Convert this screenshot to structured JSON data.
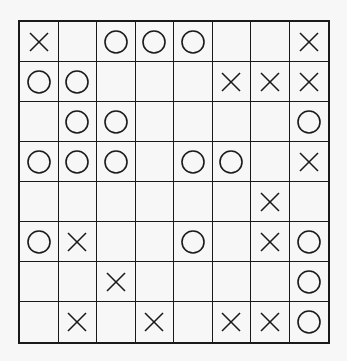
{
  "board": {
    "rows": 8,
    "cols": 8,
    "colors": {
      "line": "#1a1a1a",
      "background": "#f7f7f7",
      "mark": "#1a1a1a"
    },
    "cells": [
      [
        "X",
        "",
        "O",
        "O",
        "O",
        "",
        "",
        "X"
      ],
      [
        "O",
        "O",
        "",
        "",
        "",
        "X",
        "X",
        "X"
      ],
      [
        "",
        "O",
        "O",
        "",
        "",
        "",
        "",
        "O"
      ],
      [
        "O",
        "O",
        "O",
        "",
        "O",
        "O",
        "",
        "X"
      ],
      [
        "",
        "",
        "",
        "",
        "",
        "",
        "X",
        ""
      ],
      [
        "O",
        "X",
        "",
        "",
        "O",
        "",
        "X",
        "O"
      ],
      [
        "",
        "",
        "X",
        "",
        "",
        "",
        "",
        "O"
      ],
      [
        "",
        "X",
        "",
        "X",
        "",
        "X",
        "X",
        "O"
      ]
    ],
    "icons": {
      "X": "x-mark-icon",
      "O": "o-mark-icon"
    }
  }
}
